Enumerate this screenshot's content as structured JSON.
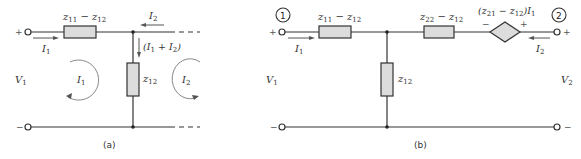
{
  "figure": {
    "panel_a": {
      "caption": "(a)",
      "series_impedance_label": "z",
      "series_impedance_sub1": "11",
      "series_impedance_minus": " − z",
      "series_impedance_sub2": "12",
      "shunt_impedance_label": "z",
      "shunt_impedance_sub": "12",
      "input_voltage": "V",
      "input_voltage_sub": "1",
      "input_current": "I",
      "input_current_sub": "1",
      "port2_current": "I",
      "port2_current_sub": "2",
      "shunt_current_open": "(I",
      "shunt_current_sub1": "1",
      "shunt_current_mid": " + I",
      "shunt_current_sub2": "2",
      "shunt_current_close": ")",
      "mesh1_label": "I",
      "mesh1_sub": "1",
      "mesh2_label": "I",
      "mesh2_sub": "2",
      "plus": "+",
      "minus": "−"
    },
    "panel_b": {
      "caption": "(b)",
      "port1_number": "1",
      "port2_number": "2",
      "series1_label": "z",
      "series1_sub1": "11",
      "series1_minus": " − z",
      "series1_sub2": "12",
      "series2_label": "z",
      "series2_sub1": "22",
      "series2_minus": " − z",
      "series2_sub2": "12",
      "shunt_label": "z",
      "shunt_sub": "12",
      "source_open": "(z",
      "source_sub1": "21",
      "source_minus": " − z",
      "source_sub2": "12",
      "source_close": ")I",
      "source_sub3": "1",
      "source_neg": "−",
      "source_pos": "+",
      "input_voltage": "V",
      "input_voltage_sub": "1",
      "output_voltage": "V",
      "output_voltage_sub": "2",
      "input_current": "I",
      "input_current_sub": "1",
      "output_current": "I",
      "output_current_sub": "2",
      "plus": "+",
      "minus": "−"
    },
    "colors": {
      "wire": "#333333",
      "component_fill": "#dcdcdc",
      "loop_arrow": "#888888"
    }
  }
}
